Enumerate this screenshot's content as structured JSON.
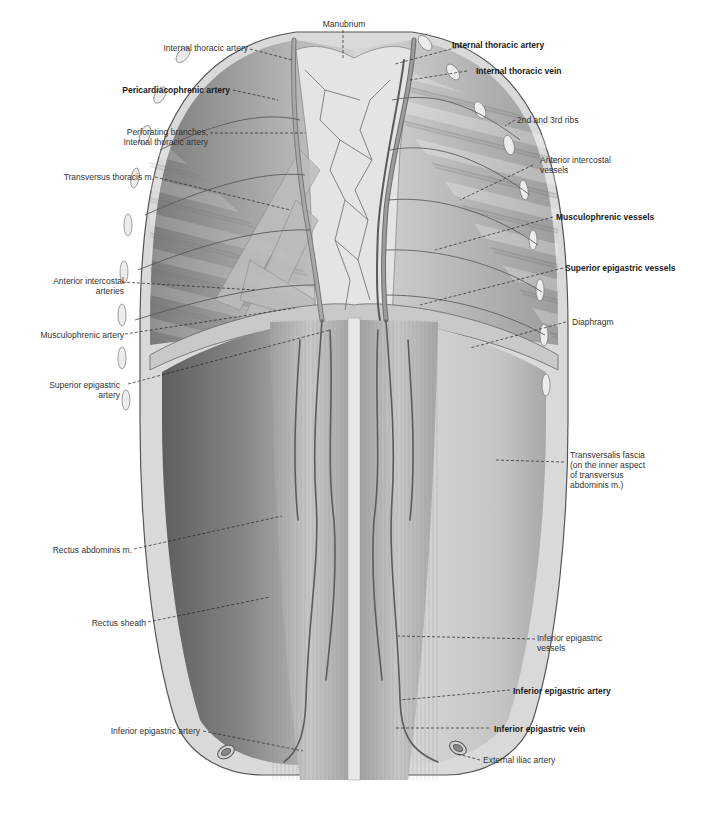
{
  "figure": {
    "colors": {
      "background": "#ffffff",
      "tissue_dark": "#6e6e6e",
      "tissue_mid": "#9a9a9a",
      "tissue_light": "#d4d4d4",
      "vessel": "#5a5a5a",
      "leader_line": "#222222",
      "label_text": "#333333"
    }
  },
  "labels": {
    "manubrium": {
      "text": [
        "Manubrium"
      ],
      "bold": false
    },
    "internal_thoracic_artery_left": {
      "text": [
        "Internal thoracic artery"
      ],
      "bold": false
    },
    "pericardiacophrenic_artery": {
      "text": [
        "Pericardiacophrenic artery"
      ],
      "bold": true
    },
    "perforating_branches": {
      "text": [
        "Perforating branches,",
        "Internal thoracic artery"
      ],
      "bold": false
    },
    "transversus_thoracis": {
      "text": [
        "Transversus thoracis m."
      ],
      "bold": false
    },
    "anterior_intercostal_arteries": {
      "text": [
        "Anterior intercostal",
        "arteries"
      ],
      "bold": false
    },
    "musculophrenic_artery": {
      "text": [
        "Musculophrenic artery"
      ],
      "bold": false
    },
    "superior_epigastric_artery": {
      "text": [
        "Superior epigastric",
        "artery"
      ],
      "bold": false
    },
    "rectus_abdominis": {
      "text": [
        "Rectus abdominis m."
      ],
      "bold": false
    },
    "rectus_sheath": {
      "text": [
        "Rectus sheath"
      ],
      "bold": false
    },
    "inferior_epigastric_artery_left": {
      "text": [
        "Inferior epigastric artery"
      ],
      "bold": false
    },
    "internal_thoracic_artery_right": {
      "text": [
        "Internal thoracic artery"
      ],
      "bold": true
    },
    "internal_thoracic_vein": {
      "text": [
        "Internal thoracic vein"
      ],
      "bold": true
    },
    "ribs_2_3": {
      "text": [
        "2nd and 3rd ribs"
      ],
      "bold": false
    },
    "anterior_intercostal_vessels": {
      "text": [
        "Anterior intercostal",
        "vessels"
      ],
      "bold": false
    },
    "musculophrenic_vessels": {
      "text": [
        "Musculophrenic vessels"
      ],
      "bold": true
    },
    "superior_epigastric_vessels": {
      "text": [
        "Superior epigastric vessels"
      ],
      "bold": true
    },
    "diaphragm": {
      "text": [
        "Diaphragm"
      ],
      "bold": false
    },
    "transversalis_fascia": {
      "text": [
        "Transversalis fascia",
        "(on the inner aspect",
        "of transversus",
        "abdominis m.)"
      ],
      "bold": false
    },
    "inferior_epigastric_vessels": {
      "text": [
        "Inferior epigastric",
        "vessels"
      ],
      "bold": false
    },
    "inferior_epigastric_artery_right": {
      "text": [
        "Inferior epigastric artery"
      ],
      "bold": true
    },
    "inferior_epigastric_vein": {
      "text": [
        "Inferior epigastric vein"
      ],
      "bold": true
    },
    "external_iliac_artery": {
      "text": [
        "External iliac artery"
      ],
      "bold": false
    }
  }
}
